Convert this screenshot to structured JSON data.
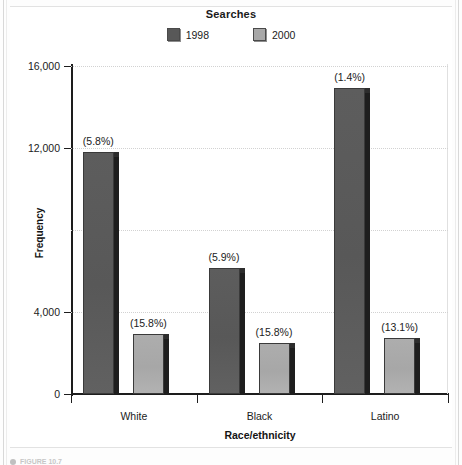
{
  "chart_data": {
    "type": "bar",
    "title": "Searches",
    "xlabel": "Race/ethnicity",
    "ylabel": "Frequency",
    "categories": [
      "White",
      "Black",
      "Latino"
    ],
    "ylim": [
      0,
      16000
    ],
    "yticks": [
      0,
      4000,
      8000,
      12000,
      16000
    ],
    "ytick_labels": [
      "0",
      "4,000",
      "8,000",
      "12,000",
      "16,000"
    ],
    "ytick_labels_visible": [
      "0",
      "4,000",
      "12,000",
      "16,000"
    ],
    "grid": true,
    "grid_axis": "y",
    "legend_position": "top-center",
    "series": [
      {
        "name": "1998",
        "color": "#585858",
        "values": [
          11800,
          6150,
          14950
        ],
        "annotations": [
          "(5.8%)",
          "(5.9%)",
          "(1.4%)"
        ]
      },
      {
        "name": "2000",
        "color": "#a8a8a8",
        "values": [
          2950,
          2500,
          2750
        ],
        "annotations": [
          "(15.8%)",
          "(15.8%)",
          "(13.1%)"
        ]
      }
    ]
  },
  "figure": {
    "caption": "FIGURE 10.7"
  }
}
